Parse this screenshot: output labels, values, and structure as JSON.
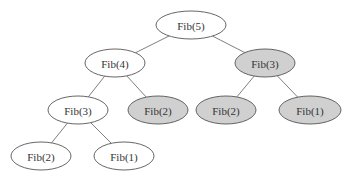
{
  "diagram": {
    "type": "recursion-tree",
    "colors": {
      "plain_fill": "#ffffff",
      "repeated_fill": "#d0d0d0",
      "stroke": "#555555",
      "edge": "#707070",
      "text": "#333333"
    },
    "nodes": [
      {
        "id": "n0",
        "label": "Fib(5)",
        "cx": 191,
        "cy": 25,
        "rx": 35,
        "ry": 14,
        "shaded": false
      },
      {
        "id": "n1",
        "label": "Fib(4)",
        "cx": 115,
        "cy": 63,
        "rx": 30,
        "ry": 14,
        "shaded": false
      },
      {
        "id": "n2",
        "label": "Fib(3)",
        "cx": 265,
        "cy": 63,
        "rx": 30,
        "ry": 14,
        "shaded": true
      },
      {
        "id": "n3",
        "label": "Fib(3)",
        "cx": 78,
        "cy": 110,
        "rx": 30,
        "ry": 14,
        "shaded": false
      },
      {
        "id": "n4",
        "label": "Fib(2)",
        "cx": 158,
        "cy": 110,
        "rx": 30,
        "ry": 14,
        "shaded": true
      },
      {
        "id": "n5",
        "label": "Fib(2)",
        "cx": 226,
        "cy": 110,
        "rx": 30,
        "ry": 14,
        "shaded": true
      },
      {
        "id": "n6",
        "label": "Fib(1)",
        "cx": 310,
        "cy": 110,
        "rx": 31,
        "ry": 14,
        "shaded": true
      },
      {
        "id": "n7",
        "label": "Fib(2)",
        "cx": 41,
        "cy": 156,
        "rx": 30,
        "ry": 14,
        "shaded": false
      },
      {
        "id": "n8",
        "label": "Fib(1)",
        "cx": 124,
        "cy": 156,
        "rx": 30,
        "ry": 14,
        "shaded": false
      }
    ],
    "edges": [
      {
        "from": "n0",
        "to": "n1"
      },
      {
        "from": "n0",
        "to": "n2"
      },
      {
        "from": "n1",
        "to": "n3"
      },
      {
        "from": "n1",
        "to": "n4"
      },
      {
        "from": "n2",
        "to": "n5"
      },
      {
        "from": "n2",
        "to": "n6"
      },
      {
        "from": "n3",
        "to": "n7"
      },
      {
        "from": "n3",
        "to": "n8"
      }
    ]
  }
}
